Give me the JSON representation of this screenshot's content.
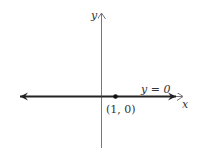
{
  "figure": {
    "axis_labels": {
      "x": "x",
      "y": "y"
    },
    "line_label": "y = 0",
    "point_label": "(1, 0)",
    "point": {
      "x": 1,
      "y": 0
    },
    "colors": {
      "axis": "#777777",
      "line": "#222222",
      "point": "#111111",
      "background": "#ffffff"
    }
  }
}
